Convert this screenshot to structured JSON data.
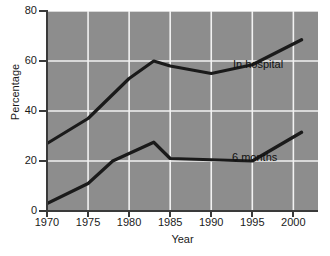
{
  "chart_data": {
    "type": "line",
    "title": "",
    "xlabel": "Year",
    "ylabel": "Percentage",
    "xlim": [
      1970,
      2003
    ],
    "ylim": [
      0,
      80
    ],
    "grid": true,
    "legend_position": "inline-annotations",
    "background_color": "#8d8d8d",
    "gridline_color": "#f2f2f2",
    "line_color": "#1a1a1a",
    "xticks": [
      1970,
      1975,
      1980,
      1985,
      1990,
      1995,
      2000
    ],
    "xtick_labels": [
      "1970",
      "1975",
      "1980",
      "1985",
      "1990",
      "1995",
      "2000"
    ],
    "yticks": [
      0,
      20,
      40,
      60,
      80
    ],
    "ytick_labels": [
      "0",
      "20",
      "40",
      "60",
      "80"
    ],
    "series": [
      {
        "name": "In hospital",
        "annotation": "In hospital",
        "x": [
          1970,
          1975,
          1980,
          1983,
          1985,
          1990,
          1995,
          2001
        ],
        "values": [
          27,
          37,
          53,
          60,
          58,
          55,
          58.5,
          68.5
        ]
      },
      {
        "name": "6 months",
        "annotation": "6 months",
        "x": [
          1970,
          1975,
          1978,
          1980,
          1983,
          1985,
          1990,
          1995,
          2001
        ],
        "values": [
          3,
          11,
          20,
          23,
          27.5,
          21,
          20.5,
          20,
          31.5
        ]
      }
    ]
  }
}
